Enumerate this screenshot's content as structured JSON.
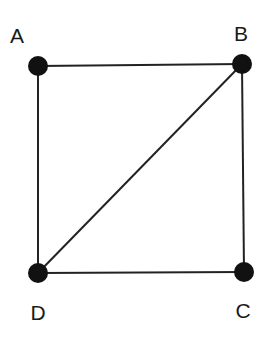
{
  "diagram": {
    "type": "graph",
    "nodes": [
      {
        "id": "A",
        "label": "A",
        "x": 38,
        "y": 66,
        "label_x": 17,
        "label_y": 43
      },
      {
        "id": "B",
        "label": "B",
        "x": 242,
        "y": 64,
        "label_x": 241,
        "label_y": 41
      },
      {
        "id": "C",
        "label": "C",
        "x": 244,
        "y": 272,
        "label_x": 243,
        "label_y": 318
      },
      {
        "id": "D",
        "label": "D",
        "x": 38,
        "y": 273,
        "label_x": 38,
        "label_y": 320
      }
    ],
    "edges": [
      {
        "from": "A",
        "to": "B"
      },
      {
        "from": "B",
        "to": "C"
      },
      {
        "from": "C",
        "to": "D"
      },
      {
        "from": "D",
        "to": "A"
      },
      {
        "from": "D",
        "to": "B"
      }
    ],
    "colors": {
      "node": "#111111",
      "edge": "#222222",
      "label": "#1a1a1a"
    }
  }
}
